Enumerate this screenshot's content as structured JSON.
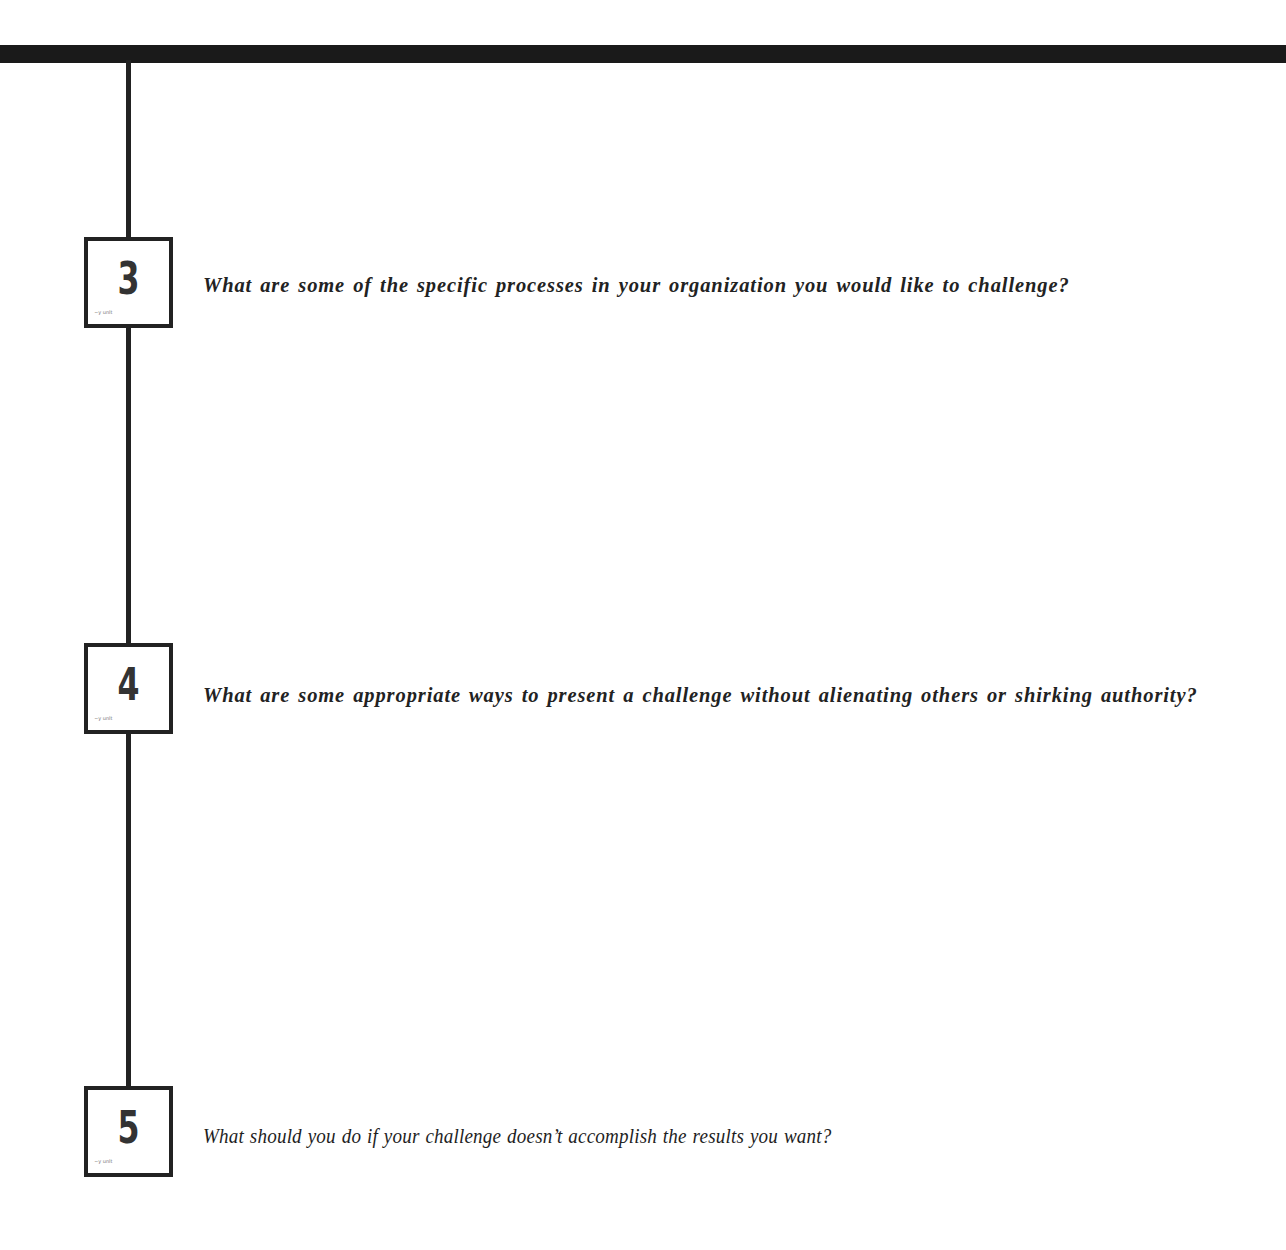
{
  "page": {
    "top_rule_color": "#1a1a1a",
    "line_color": "#222222"
  },
  "steps": [
    {
      "number": "3",
      "scribble": "~y unlt",
      "question": "What are some of the specific processes in your organization you would like to challenge?"
    },
    {
      "number": "4",
      "scribble": "~y unlt",
      "question": "What are some appropriate ways to present a challenge without alienating others or shirking authority?"
    },
    {
      "number": "5",
      "scribble": "~y unlt",
      "question": "What should you do if your challenge doesn’t accomplish the results you want?"
    }
  ]
}
